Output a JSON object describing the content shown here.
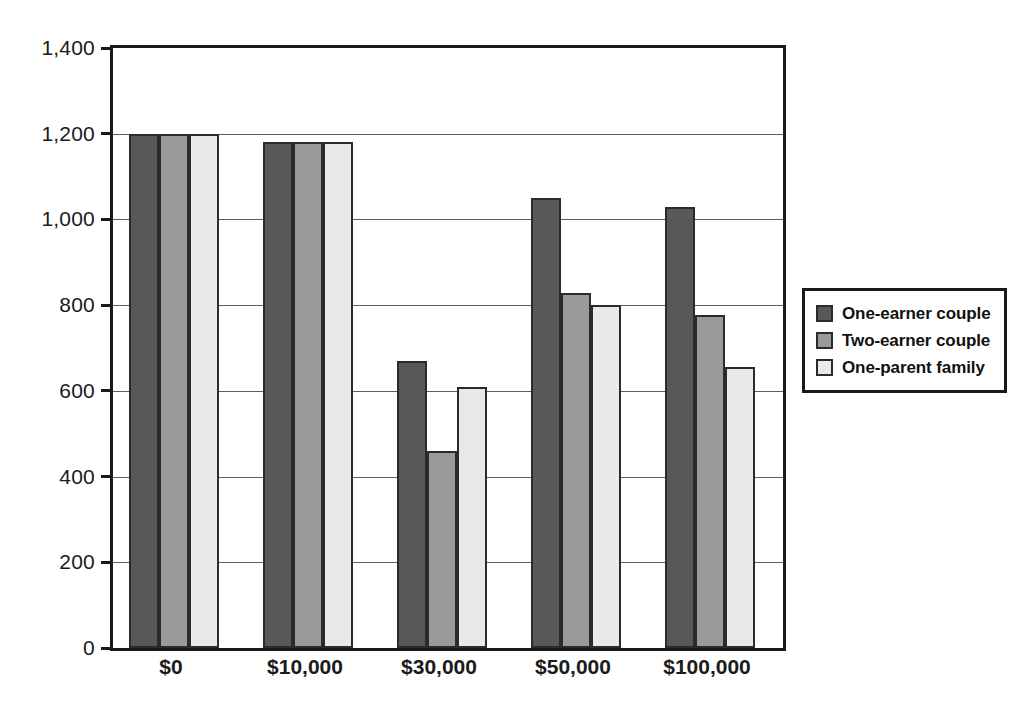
{
  "chart_data": {
    "type": "bar",
    "title": "",
    "subtitle": "",
    "xlabel": "",
    "ylabel": "",
    "categories": [
      "$0",
      "$10,000",
      "$30,000",
      "$50,000",
      "$100,000"
    ],
    "series": [
      {
        "name": "One-earner couple",
        "color": "#585858",
        "values": [
          1200,
          1180,
          670,
          1050,
          1028
        ]
      },
      {
        "name": "Two-earner couple",
        "color": "#9a9a9a",
        "values": [
          1200,
          1180,
          460,
          828,
          778
        ]
      },
      {
        "name": "One-parent family",
        "color": "#e9e9e9",
        "values": [
          1200,
          1180,
          610,
          800,
          655
        ]
      }
    ],
    "ylim": [
      0,
      1400
    ],
    "ytick_values": [
      0,
      200,
      400,
      600,
      800,
      1000,
      1200,
      1400
    ],
    "ytick_labels": [
      "0",
      "200",
      "400",
      "600",
      "800",
      "1,000",
      "1,200",
      "1,400"
    ],
    "grid": true,
    "grid_axis": "y",
    "legend_position": "right",
    "bar_border_color": "#2b2b2b",
    "axis_color": "#1a1a1a",
    "background_color": "#ffffff"
  }
}
